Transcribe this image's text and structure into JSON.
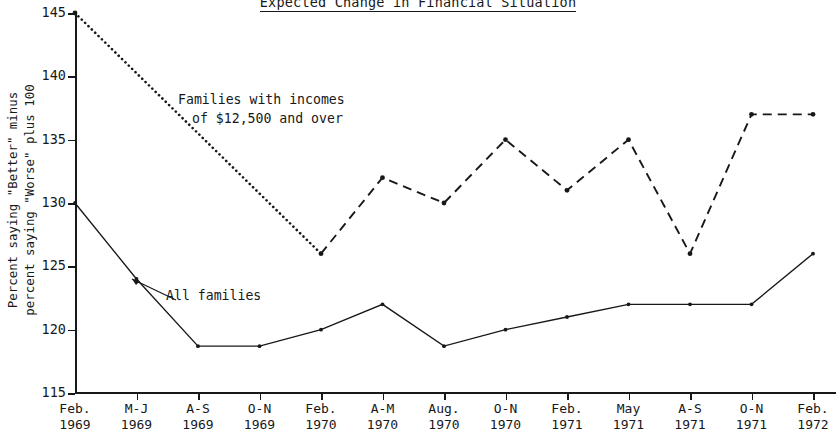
{
  "title": "Expected Change in Financial Situation",
  "y_axis": {
    "label_line1": "Percent saying \"Better\" minus",
    "label_line2": "percent saying \"Worse\" plus 100",
    "ticks": [
      "145",
      "140",
      "135",
      "130",
      "125",
      "120",
      "115"
    ]
  },
  "x_axis": {
    "labels": [
      {
        "l1": "Feb.",
        "l2": "1969"
      },
      {
        "l1": "M-J",
        "l2": "1969"
      },
      {
        "l1": "A-S",
        "l2": "1969"
      },
      {
        "l1": "O-N",
        "l2": "1969"
      },
      {
        "l1": "Feb.",
        "l2": "1970"
      },
      {
        "l1": "A-M",
        "l2": "1970"
      },
      {
        "l1": "Aug.",
        "l2": "1970"
      },
      {
        "l1": "O-N",
        "l2": "1970"
      },
      {
        "l1": "Feb.",
        "l2": "1971"
      },
      {
        "l1": "May",
        "l2": "1971"
      },
      {
        "l1": "A-S",
        "l2": "1971"
      },
      {
        "l1": "O-N",
        "l2": "1971"
      },
      {
        "l1": "Feb.",
        "l2": "1972"
      }
    ]
  },
  "annotations": {
    "high_income_line1": "Families with incomes",
    "high_income_line2": "of $12,500 and over",
    "all_families": "All families"
  },
  "colors": {
    "ink": "#17181a",
    "background": "#ffffff"
  },
  "chart_data": {
    "type": "line",
    "title": "Expected Change in Financial Situation",
    "xlabel": "",
    "ylabel": "Percent saying \"Better\" minus percent saying \"Worse\" plus 100",
    "ylim": [
      115,
      145
    ],
    "ytick_values": [
      115,
      120,
      125,
      130,
      135,
      140,
      145
    ],
    "grid": false,
    "legend": "inline annotations",
    "categories": [
      "Feb. 1969",
      "M-J 1969",
      "A-S 1969",
      "O-N 1969",
      "Feb. 1970",
      "A-M 1970",
      "Aug. 1970",
      "O-N 1970",
      "Feb. 1971",
      "May 1971",
      "A-S 1971",
      "O-N 1971",
      "Feb. 1972"
    ],
    "series": [
      {
        "name": "Families with incomes of $12,500 and over",
        "style": "dotted-then-dashed",
        "values": [
          145,
          null,
          null,
          null,
          126,
          132,
          130,
          135,
          131,
          135,
          126,
          137,
          137
        ]
      },
      {
        "name": "All families",
        "style": "solid",
        "values": [
          130,
          124,
          118.7,
          118.7,
          120,
          122,
          118.7,
          120,
          121,
          122,
          122,
          122,
          126
        ]
      }
    ]
  }
}
